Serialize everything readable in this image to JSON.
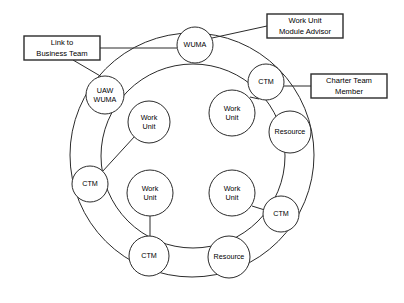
{
  "diagram": {
    "background_color": "#ffffff",
    "stroke_color": "#2b2b2b",
    "rings": [
      {
        "name": "outer-ring",
        "cx": 192,
        "cy": 155,
        "r": 122
      },
      {
        "name": "inner-ring",
        "cx": 193,
        "cy": 156,
        "r": 92
      }
    ],
    "nodes": [
      {
        "id": "wuma-top",
        "label_line1": "WUMA",
        "label_line2": "",
        "cx": 195,
        "cy": 45,
        "r": 18
      },
      {
        "id": "uaw-wuma-left",
        "label_line1": "UAW",
        "label_line2": "WUMA",
        "cx": 105,
        "cy": 95,
        "r": 19
      },
      {
        "id": "ctm-upper-right",
        "label_line1": "CTM",
        "label_line2": "",
        "cx": 266,
        "cy": 82,
        "r": 18
      },
      {
        "id": "resource-right",
        "label_line1": "Resource",
        "label_line2": "",
        "cx": 290,
        "cy": 132,
        "r": 21
      },
      {
        "id": "ctm-lower-right",
        "label_line1": "CTM",
        "label_line2": "",
        "cx": 281,
        "cy": 214,
        "r": 18
      },
      {
        "id": "resource-bottom",
        "label_line1": "Resource",
        "label_line2": "",
        "cx": 229,
        "cy": 257,
        "r": 21
      },
      {
        "id": "ctm-bottom",
        "label_line1": "CTM",
        "label_line2": "",
        "cx": 149,
        "cy": 256,
        "r": 20
      },
      {
        "id": "ctm-left",
        "label_line1": "CTM",
        "label_line2": "",
        "cx": 90,
        "cy": 184,
        "r": 18
      },
      {
        "id": "work-unit-tl",
        "label_line1": "Work",
        "label_line2": "Unit",
        "cx": 149,
        "cy": 122,
        "r": 21
      },
      {
        "id": "work-unit-tr",
        "label_line1": "Work",
        "label_line2": "Unit",
        "cx": 232,
        "cy": 113,
        "r": 23
      },
      {
        "id": "work-unit-bl",
        "label_line1": "Work",
        "label_line2": "Unit",
        "cx": 150,
        "cy": 193,
        "r": 23
      },
      {
        "id": "work-unit-br",
        "label_line1": "Work",
        "label_line2": "Unit",
        "cx": 232,
        "cy": 193,
        "r": 23
      }
    ],
    "callouts": [
      {
        "id": "link-to-business-team",
        "line1": "Link to",
        "line2": "Business Team",
        "x": 24,
        "y": 36,
        "w": 76,
        "h": 24
      },
      {
        "id": "work-unit-module-advisor",
        "line1": "Work Unit",
        "line2": "Module Advisor",
        "x": 267,
        "y": 14,
        "w": 76,
        "h": 24
      },
      {
        "id": "charter-team-member",
        "line1": "Charter Team",
        "line2": "Member",
        "x": 311,
        "y": 74,
        "w": 76,
        "h": 24
      }
    ],
    "connectors": [
      {
        "id": "callout-link-to-wuma-top",
        "d": "M 100 48 L 177 48"
      },
      {
        "id": "callout-link-to-uaw-wuma",
        "d": "M 73 60 L 102 77"
      },
      {
        "id": "callout-advisor-to-wuma-top",
        "d": "M 267 26 L 212 38"
      },
      {
        "id": "callout-charter-to-ctm",
        "d": "M 311 86 L 284 86"
      },
      {
        "id": "work-unit-tl-to-ctm-left",
        "d": "M 135 136 L 102 172"
      },
      {
        "id": "work-unit-bl-to-ctm-bottom",
        "d": "M 150 216 L 150 236"
      },
      {
        "id": "work-unit-br-to-ctm-lower-right",
        "d": "M 252 206 L 268 211"
      },
      {
        "id": "work-unit-tr-to-ctm-upper-right",
        "d": "M 250 97 L 259 99"
      }
    ]
  }
}
